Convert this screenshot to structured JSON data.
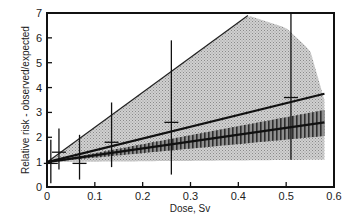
{
  "chart_data": {
    "type": "scatter",
    "title": "",
    "xlabel": "Dose, Sv",
    "ylabel": "Relative risk - observed/expected",
    "xlim": [
      0,
      0.6
    ],
    "ylim": [
      0,
      7
    ],
    "x_ticks": [
      "0",
      "0.1",
      "0.2",
      "0.3",
      "0.4",
      "0.5",
      "0.6"
    ],
    "y_ticks": [
      "0",
      "1",
      "2",
      "3",
      "4",
      "5",
      "6",
      "7"
    ],
    "grid": false,
    "legend": null,
    "points": [
      {
        "x": 0.008,
        "y": 0.95,
        "ylow": 0.15,
        "yhigh": 1.9
      },
      {
        "x": 0.025,
        "y": 1.4,
        "ylow": 0.7,
        "yhigh": 2.35
      },
      {
        "x": 0.068,
        "y": 0.95,
        "ylow": 0.3,
        "yhigh": 2.1
      },
      {
        "x": 0.135,
        "y": 1.8,
        "ylow": 0.8,
        "yhigh": 3.4
      },
      {
        "x": 0.26,
        "y": 2.6,
        "ylow": 0.5,
        "yhigh": 5.9
      },
      {
        "x": 0.51,
        "y": 3.6,
        "ylow": 1.1,
        "yhigh": 7.0
      }
    ],
    "fit_lines": [
      {
        "name": "upper-fit",
        "x": [
          0,
          0.58
        ],
        "y": [
          1.0,
          3.75
        ]
      },
      {
        "name": "central-fit",
        "x": [
          0,
          0.58
        ],
        "y": [
          1.0,
          2.6
        ]
      }
    ],
    "bands": [
      {
        "name": "wide-confidence-region",
        "style": "light-stipple",
        "upper": {
          "x": [
            0,
            0.42,
            0.5,
            0.55,
            0.58
          ],
          "y": [
            1.0,
            6.9,
            6.4,
            5.5,
            3.5
          ]
        },
        "lower": {
          "x": [
            0,
            0.58
          ],
          "y": [
            1.0,
            1.1
          ]
        }
      },
      {
        "name": "narrow-confidence-band",
        "style": "dark-hatched",
        "upper": {
          "x": [
            0,
            0.58
          ],
          "y": [
            1.0,
            3.1
          ]
        },
        "lower": {
          "x": [
            0,
            0.58
          ],
          "y": [
            1.0,
            2.05
          ]
        }
      }
    ]
  },
  "labels": {
    "xlabel": "Dose, Sv",
    "ylabel": "Relative risk - observed/expected"
  }
}
